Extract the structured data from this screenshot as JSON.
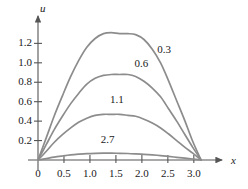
{
  "chart_data": {
    "type": "line",
    "title": "",
    "subtitle": "",
    "xlabel": "x",
    "ylabel": "u",
    "xlim": [
      0,
      3.35
    ],
    "ylim": [
      0,
      1.42
    ],
    "grid": false,
    "legend_position": "inline-labels",
    "xticks": [
      "0",
      "0.5",
      "1.0",
      "1.5",
      "2.0",
      "2.5",
      "3.0"
    ],
    "xtick_values": [
      0,
      0.5,
      1.0,
      1.5,
      2.0,
      2.5,
      3.0
    ],
    "yticks": [
      "0.2",
      "0.4",
      "0.6",
      "0.8",
      "1.0",
      "1.2"
    ],
    "ytick_values": [
      0.2,
      0.4,
      0.6,
      0.8,
      1.0,
      1.2
    ],
    "curve_color": "#8c8c8c",
    "axis_color": "#555555",
    "series": [
      {
        "name": "0.3",
        "label": "0.3",
        "peak_x": 1.85,
        "peak_y": 1.3,
        "x": [
          0.0,
          0.16,
          0.31,
          0.47,
          0.63,
          0.79,
          0.94,
          1.1,
          1.26,
          1.41,
          1.57,
          1.73,
          1.88,
          2.04,
          2.2,
          2.36,
          2.51,
          2.67,
          2.83,
          2.98,
          3.14
        ],
        "y": [
          0.0,
          0.23,
          0.45,
          0.66,
          0.86,
          1.03,
          1.16,
          1.25,
          1.3,
          1.31,
          1.3,
          1.3,
          1.29,
          1.24,
          1.14,
          1.0,
          0.82,
          0.61,
          0.4,
          0.19,
          0.0
        ]
      },
      {
        "name": "0.6",
        "label": "0.6",
        "peak_x": 1.75,
        "peak_y": 0.88,
        "x": [
          0.0,
          0.16,
          0.31,
          0.47,
          0.63,
          0.79,
          0.94,
          1.1,
          1.26,
          1.41,
          1.57,
          1.73,
          1.88,
          2.04,
          2.2,
          2.36,
          2.51,
          2.67,
          2.83,
          2.98,
          3.14
        ],
        "y": [
          0.0,
          0.16,
          0.31,
          0.45,
          0.58,
          0.69,
          0.78,
          0.84,
          0.87,
          0.88,
          0.88,
          0.88,
          0.86,
          0.81,
          0.74,
          0.65,
          0.53,
          0.4,
          0.26,
          0.13,
          0.0
        ]
      },
      {
        "name": "1.1",
        "label": "1.1",
        "peak_x": 1.65,
        "peak_y": 0.47,
        "x": [
          0.0,
          0.16,
          0.31,
          0.47,
          0.63,
          0.79,
          0.94,
          1.1,
          1.26,
          1.41,
          1.57,
          1.73,
          1.88,
          2.04,
          2.2,
          2.36,
          2.51,
          2.67,
          2.83,
          2.98,
          3.14
        ],
        "y": [
          0.0,
          0.09,
          0.18,
          0.26,
          0.33,
          0.39,
          0.43,
          0.46,
          0.47,
          0.47,
          0.47,
          0.46,
          0.45,
          0.42,
          0.38,
          0.33,
          0.27,
          0.2,
          0.13,
          0.07,
          0.0
        ]
      },
      {
        "name": "2.7",
        "label": "2.7",
        "peak_x": 1.5,
        "peak_y": 0.07,
        "x": [
          0.0,
          0.16,
          0.31,
          0.47,
          0.63,
          0.79,
          0.94,
          1.1,
          1.26,
          1.41,
          1.57,
          1.73,
          1.88,
          2.04,
          2.2,
          2.36,
          2.51,
          2.67,
          2.83,
          2.98,
          3.14
        ],
        "y": [
          0.0,
          0.015,
          0.029,
          0.041,
          0.052,
          0.06,
          0.066,
          0.069,
          0.07,
          0.07,
          0.069,
          0.067,
          0.063,
          0.058,
          0.052,
          0.045,
          0.037,
          0.028,
          0.019,
          0.01,
          0.0
        ]
      }
    ],
    "curve_label_positions": [
      {
        "label": "0.3",
        "x": 2.47,
        "y": 1.13
      },
      {
        "label": "0.6",
        "x": 2.03,
        "y": 0.99
      },
      {
        "label": "1.1",
        "x": 1.56,
        "y": 0.62
      },
      {
        "label": "2.7",
        "x": 1.38,
        "y": 0.21
      }
    ]
  }
}
